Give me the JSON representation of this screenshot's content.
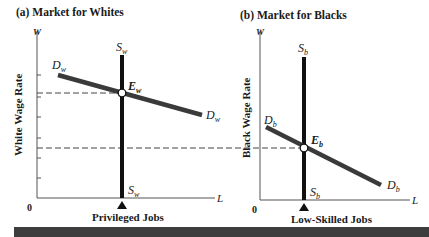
{
  "panels": [
    {
      "id": "a",
      "title": "(a)  Market for Whites",
      "y_axis_symbol": "W",
      "y_axis_label": "White Wage Rate",
      "x_axis_symbol": "L",
      "x_axis_label": "Privileged Jobs",
      "origin_label": "0",
      "supply_top": {
        "main": "S",
        "sub": "w"
      },
      "supply_bottom": {
        "main": "S",
        "sub": "w"
      },
      "demand_left": {
        "main": "D",
        "sub": "w"
      },
      "demand_right": {
        "main": "D",
        "sub": "w"
      },
      "equilibrium": {
        "main": "E",
        "sub": "w"
      }
    },
    {
      "id": "b",
      "title": "(b)  Market for Blacks",
      "y_axis_symbol": "W",
      "y_axis_label": "Black Wage Rate",
      "x_axis_symbol": "L",
      "x_axis_label": "Low-Skilled Jobs",
      "origin_label": "0",
      "supply_top": {
        "main": "S",
        "sub": "b"
      },
      "supply_bottom": {
        "main": "S",
        "sub": "b"
      },
      "demand_left": {
        "main": "D",
        "sub": "b"
      },
      "demand_right": {
        "main": "D",
        "sub": "b"
      },
      "equilibrium": {
        "main": "E",
        "sub": "b"
      }
    }
  ],
  "colors": {
    "axis": "#555555",
    "supply": "#111111",
    "demand": "#3a3a3a",
    "dashed": "#444444",
    "bottom_bar": "#3d3d3d"
  }
}
